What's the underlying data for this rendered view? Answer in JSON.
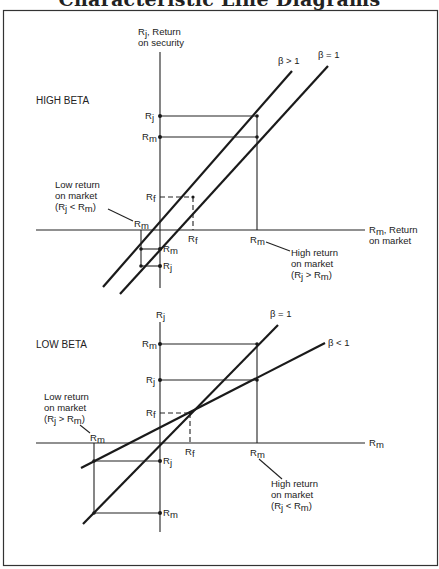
{
  "title": "Characteristic Line Diagrams",
  "high_beta": {
    "heading": "HIGH BETA",
    "y_axis_label_line1": "R",
    "y_axis_label_sub": "j",
    "y_axis_label_rest": ", Return",
    "y_axis_label_line2": "on security",
    "x_axis_label_main": "R",
    "x_axis_label_sub": "m",
    "x_axis_label_rest": ", Return",
    "x_axis_label_line2": "on market",
    "line_labels": [
      "β > 1",
      "β = 1"
    ],
    "low_note": [
      "Low return",
      "on market",
      "(R",
      "j",
      " < R",
      "m",
      ")"
    ],
    "high_note": [
      "High return",
      "on market",
      "(R",
      "j",
      " > R",
      "m",
      ")"
    ],
    "point_labels": {
      "Rj_top": "R",
      "Rj_top_sub": "j",
      "Rm_top": "R",
      "Rm_top_sub": "m",
      "Rf_y": "R",
      "Rf_y_sub": "f",
      "Rf_x": "R",
      "Rf_x_sub": "f",
      "Rm_x_high": "R",
      "Rm_x_high_sub": "m",
      "Rm_x_low": "R",
      "Rm_x_low_sub": "m",
      "Rm_low": "R",
      "Rm_low_sub": "m",
      "Rj_low": "R",
      "Rj_low_sub": "j"
    }
  },
  "low_beta": {
    "heading": "LOW BETA",
    "y_axis_label": "R",
    "y_axis_label_sub": "j",
    "x_axis_label": "R",
    "x_axis_label_sub": "m",
    "line_labels": [
      "β = 1",
      "β < 1"
    ],
    "low_note": [
      "Low return",
      "on market",
      "(R",
      "j",
      " > R",
      "m",
      ")"
    ],
    "high_note": [
      "High return",
      "on market",
      "(R",
      "j",
      " < R",
      "m",
      ")"
    ],
    "point_labels": {
      "Rm_top": "R",
      "Rm_top_sub": "m",
      "Rj_top": "R",
      "Rj_top_sub": "j",
      "Rf_y": "R",
      "Rf_y_sub": "f",
      "Rf_x": "R",
      "Rf_x_sub": "f",
      "Rm_x_high": "R",
      "Rm_x_high_sub": "m",
      "Rm_x_low": "R",
      "Rm_x_low_sub": "m",
      "Rj_low": "R",
      "Rj_low_sub": "j",
      "Rm_low": "R",
      "Rm_low_sub": "m"
    }
  }
}
